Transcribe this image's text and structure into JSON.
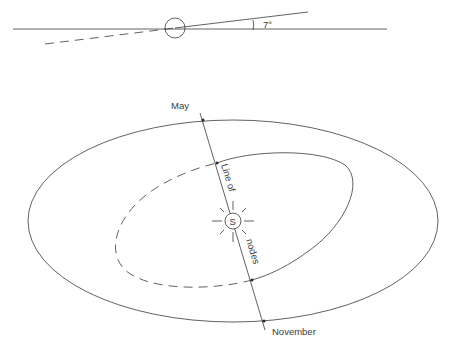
{
  "inclination_panel": {
    "angle_label": "7°",
    "reference_plane": "ecliptic",
    "orbit_above": "solid line",
    "orbit_below": "dashed line"
  },
  "orbit_panel": {
    "node_top_label": "May",
    "node_bottom_label": "November",
    "line_label_part1": "Line of",
    "line_label_part2": "nodes",
    "sun_label": "S"
  },
  "colors": {
    "line": "#3a3a3a",
    "background": "#ffffff"
  }
}
